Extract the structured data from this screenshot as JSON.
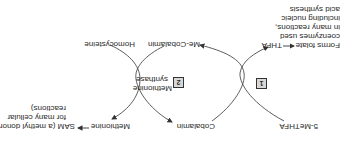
{
  "diagram": {
    "orientation": "rotated 180 degrees",
    "cycle_1": {
      "step_number": "1",
      "substrate": "5-MeTHFA",
      "product": "THFA",
      "product_note_prefix": "Forms folate",
      "product_note_lines": [
        "coenzymes used",
        "in many reactions,",
        "including nucleic",
        "acid synthesis"
      ]
    },
    "cycle_2": {
      "step_number": "2",
      "enzyme_line1": "Methionine",
      "enzyme_line2": "synthase",
      "cofactor_in": "Cobalamin",
      "cofactor_out": "Me-Cobalamin",
      "substrate": "Homocysteine",
      "product": "Methionine",
      "product_note_line1": "SAM (a methyl donor",
      "product_note_line2": "for many cellular",
      "product_note_line3": "reactions)"
    },
    "colors": {
      "line": "#4a4a4a",
      "text": "#2a2a2a",
      "box_fill": "#d8d8d8"
    }
  }
}
